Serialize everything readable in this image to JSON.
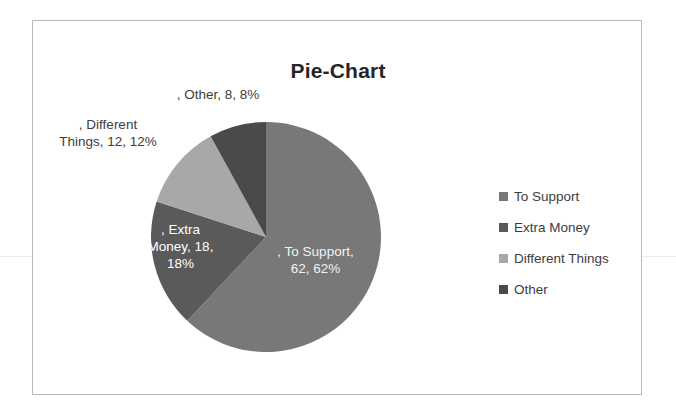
{
  "chart_data": {
    "type": "pie",
    "title": "Pie-Chart",
    "categories": [
      "To Support",
      "Extra Money",
      "Different Things",
      "Other"
    ],
    "values": [
      62,
      18,
      12,
      8
    ],
    "percentages": [
      62,
      18,
      12,
      8
    ],
    "colors": [
      "#787878",
      "#5a5a5a",
      "#a8a8a8",
      "#4a4a4a"
    ],
    "start_angle_deg": 0,
    "direction": "clockwise",
    "legend_position": "right",
    "grid": false,
    "data_labels": [
      ", To Support,\n62, 62%",
      ", Extra\nMoney, 18,\n18%",
      ", Different\nThings, 12, 12%",
      ", Other, 8, 8%"
    ]
  },
  "legend": {
    "items": [
      {
        "label": "To Support",
        "color": "#787878"
      },
      {
        "label": "Extra Money",
        "color": "#5a5a5a"
      },
      {
        "label": "Different Things",
        "color": "#a8a8a8"
      },
      {
        "label": "Other",
        "color": "#4a4a4a"
      }
    ]
  }
}
